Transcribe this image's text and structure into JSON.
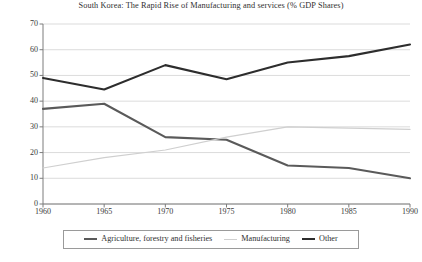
{
  "chart_data": {
    "type": "line",
    "title": "South Korea: The Rapid Rise of Manufacturing and services (% GDP Shares)",
    "xlabel": "",
    "ylabel": "",
    "x": [
      1960,
      1965,
      1970,
      1975,
      1980,
      1985,
      1990
    ],
    "categories": [
      "1960",
      "1965",
      "1970",
      "1975",
      "1980",
      "1985",
      "1990"
    ],
    "xlim": [
      1960,
      1990
    ],
    "ylim": [
      0,
      70
    ],
    "y_ticks": [
      0,
      10,
      20,
      30,
      40,
      50,
      60,
      70
    ],
    "x_ticks": [
      1960,
      1965,
      1970,
      1975,
      1980,
      1985,
      1990
    ],
    "grid": "horizontal",
    "legend_position": "bottom",
    "series": [
      {
        "name": "Agriculture, forestry and fisheries",
        "color": "#5a5a5a",
        "width": 2.1,
        "values": [
          37,
          39,
          26,
          25,
          15,
          14,
          10
        ]
      },
      {
        "name": "Manufacturing",
        "color": "#cfcfcf",
        "width": 1.2,
        "values": [
          14,
          18,
          21,
          26,
          30,
          29.5,
          29
        ]
      },
      {
        "name": "Other",
        "color": "#2d2d2d",
        "width": 2.1,
        "values": [
          49,
          44.5,
          54,
          48.5,
          55,
          57.5,
          62
        ]
      }
    ]
  },
  "axis": {
    "y_tick_labels": [
      "70",
      "60",
      "50",
      "40",
      "30",
      "20",
      "10",
      "0"
    ],
    "x_tick_labels": [
      "1960",
      "1965",
      "1970",
      "1975",
      "1980",
      "1985",
      "1990"
    ]
  },
  "legend": {
    "items": [
      {
        "label": "Agriculture, forestry and fisheries",
        "color": "#5a5a5a",
        "thickness": "2px"
      },
      {
        "label": "Manufacturing",
        "color": "#cfcfcf",
        "thickness": "1px"
      },
      {
        "label": "Other",
        "color": "#2d2d2d",
        "thickness": "2px"
      }
    ]
  }
}
